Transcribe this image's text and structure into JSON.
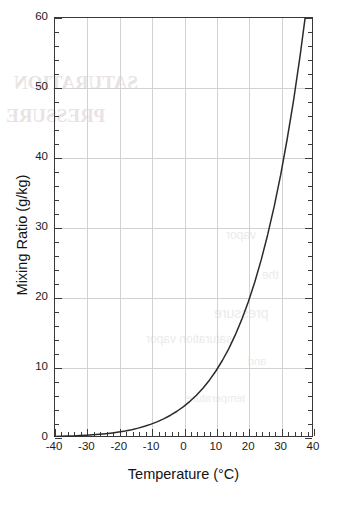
{
  "chart_data": {
    "type": "line",
    "title": "",
    "xlabel": "Temperature (°C)",
    "ylabel": "Mixing Ratio (g/kg)",
    "xlim": [
      -40,
      40
    ],
    "ylim": [
      0,
      60
    ],
    "xticks": [
      -40,
      -30,
      -20,
      -10,
      0,
      10,
      20,
      30,
      40
    ],
    "xtick_labels": [
      "-40",
      "-30",
      "-20",
      "-10",
      "0",
      "10",
      "20",
      "30",
      "40"
    ],
    "yticks": [
      0,
      10,
      20,
      30,
      40,
      50,
      60
    ],
    "ytick_labels": [
      "0",
      "10",
      "20",
      "30",
      "40",
      "50",
      "60"
    ],
    "x_minor_tick_interval": 2,
    "y_minor_tick_interval": 2,
    "grid": true,
    "grid_axes": "both",
    "grid_color": "#d2d2d6",
    "legend": "none",
    "line_color": "#2b2b2b",
    "frame_color": "#3a3a3a",
    "series": [
      {
        "name": "Saturation mixing ratio",
        "x": [
          -40,
          -38,
          -36,
          -34,
          -32,
          -30,
          -28,
          -26,
          -24,
          -22,
          -20,
          -18,
          -16,
          -14,
          -12,
          -10,
          -8,
          -6,
          -4,
          -2,
          0,
          2,
          4,
          6,
          8,
          10,
          12,
          14,
          16,
          18,
          20,
          22,
          24,
          26,
          28,
          30,
          32,
          34,
          36,
          38,
          40
        ],
        "values": [
          0.08,
          0.1,
          0.13,
          0.16,
          0.2,
          0.25,
          0.31,
          0.38,
          0.47,
          0.58,
          0.71,
          0.86,
          1.05,
          1.27,
          1.53,
          1.84,
          2.2,
          2.62,
          3.11,
          3.68,
          4.34,
          5.1,
          5.97,
          6.97,
          8.12,
          9.43,
          10.93,
          12.63,
          14.58,
          16.8,
          19.3,
          22.1,
          25.3,
          28.9,
          32.9,
          37.4,
          42.5,
          48.1,
          54.4,
          61.4,
          69.1
        ]
      }
    ],
    "annotations": []
  },
  "artifacts": {
    "note": "faint bleed-through text visible from the reverse of the scanned page",
    "blocks": [
      {
        "text": "SATURATION",
        "left": 14,
        "top": 72,
        "size": 19
      },
      {
        "text": "PRESSURE",
        "left": 6,
        "top": 105,
        "size": 19
      },
      {
        "text": "vapor",
        "left": 226,
        "top": 228,
        "size": 12
      },
      {
        "text": "the",
        "left": 262,
        "top": 268,
        "size": 12
      },
      {
        "text": "pressure",
        "left": 214,
        "top": 305,
        "size": 14
      },
      {
        "text": "saturation vapor",
        "left": 146,
        "top": 332,
        "size": 12
      },
      {
        "text": "and",
        "left": 248,
        "top": 355,
        "size": 11
      },
      {
        "text": "temperature",
        "left": 186,
        "top": 392,
        "size": 11
      }
    ]
  }
}
